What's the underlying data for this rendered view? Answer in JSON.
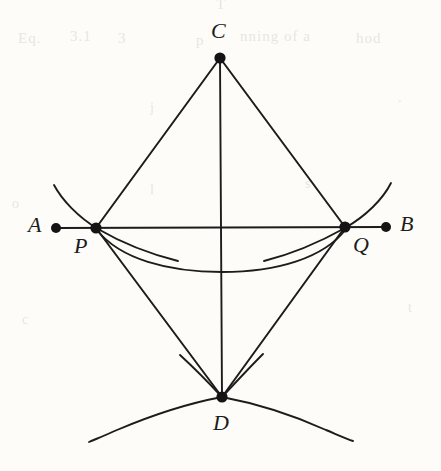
{
  "figure": {
    "caption": "",
    "background_color": "#fdfcf8",
    "ink_color": "#1c1c1c",
    "width": 441,
    "height": 471,
    "labels": {
      "A": "A",
      "B": "B",
      "C": "C",
      "D": "D",
      "P": "P",
      "Q": "Q"
    },
    "points": {
      "A": {
        "x": 56,
        "y": 228
      },
      "B": {
        "x": 386,
        "y": 227
      },
      "C": {
        "x": 220,
        "y": 58
      },
      "D": {
        "x": 222,
        "y": 397
      },
      "P": {
        "x": 96,
        "y": 228
      },
      "Q": {
        "x": 345,
        "y": 227
      }
    },
    "label_positions": {
      "A": {
        "x": 28,
        "y": 214
      },
      "B": {
        "x": 400,
        "y": 213
      },
      "C": {
        "x": 211,
        "y": 20
      },
      "D": {
        "x": 213,
        "y": 412
      },
      "P": {
        "x": 74,
        "y": 235
      },
      "Q": {
        "x": 353,
        "y": 234
      }
    },
    "segments": [
      {
        "name": "line-AB",
        "from": "A",
        "to": "B"
      },
      {
        "name": "line-CP",
        "from": "C",
        "to": "P"
      },
      {
        "name": "line-CQ",
        "from": "C",
        "to": "Q"
      },
      {
        "name": "line-CD",
        "from": "C",
        "to": "D"
      },
      {
        "name": "line-PD",
        "from": "P",
        "to": "D"
      },
      {
        "name": "line-QD",
        "from": "Q",
        "to": "D"
      }
    ],
    "arcs": [
      {
        "name": "arc-through-P",
        "note": "compass arc centred near Q passing through P"
      },
      {
        "name": "arc-through-Q",
        "note": "compass arc centred near P passing through Q"
      },
      {
        "name": "arc-P-to-Q-below-AB",
        "note": "arc from P to Q dipping below line AB"
      },
      {
        "name": "arc-left-through-D",
        "note": "compass arc crossing at D, opening lower-left"
      },
      {
        "name": "arc-right-through-D",
        "note": "compass arc crossing at D, opening lower-right"
      },
      {
        "name": "arc-tick-left-at-D",
        "note": "short construction arc remnant left of D"
      },
      {
        "name": "arc-tick-right-at-D",
        "note": "short construction arc remnant right of D"
      }
    ],
    "bleed_through": [
      {
        "text": "T",
        "x": 216,
        "y": -4,
        "size": 15
      },
      {
        "text": "Eq.",
        "x": 18,
        "y": 30,
        "size": 15
      },
      {
        "text": "3.1",
        "x": 70,
        "y": 28,
        "size": 15
      },
      {
        "text": "3",
        "x": 118,
        "y": 30,
        "size": 15
      },
      {
        "text": "p",
        "x": 196,
        "y": 32,
        "size": 15
      },
      {
        "text": "nning of a",
        "x": 240,
        "y": 28,
        "size": 15
      },
      {
        "text": "hod",
        "x": 356,
        "y": 30,
        "size": 15
      },
      {
        "text": "j",
        "x": 150,
        "y": 100,
        "size": 14
      },
      {
        "text": ".",
        "x": 398,
        "y": 90,
        "size": 14
      },
      {
        "text": "l",
        "x": 150,
        "y": 182,
        "size": 14
      },
      {
        "text": "s",
        "x": 305,
        "y": 176,
        "size": 14
      },
      {
        "text": "o",
        "x": 12,
        "y": 196,
        "size": 14
      },
      {
        "text": "t",
        "x": 408,
        "y": 300,
        "size": 14
      },
      {
        "text": "c",
        "x": 22,
        "y": 312,
        "size": 14
      }
    ]
  }
}
